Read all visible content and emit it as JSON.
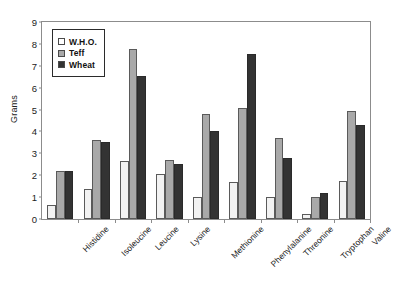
{
  "chart_data": {
    "type": "bar",
    "title": "",
    "xlabel": "",
    "ylabel": "Grams",
    "ylim": [
      0,
      9
    ],
    "yticks": [
      0,
      1,
      2,
      3,
      4,
      5,
      6,
      7,
      8,
      9
    ],
    "grid": false,
    "legend_position": "top-left-inside",
    "categories": [
      "Histidine",
      "Isoleucine",
      "Leucine",
      "Lysine",
      "Methionine",
      "Phenylalanine",
      "Threonine",
      "Tryptophan",
      "Valine"
    ],
    "series": [
      {
        "name": "W.H.O.",
        "color": "#f2f2f2",
        "values": [
          0.65,
          1.35,
          2.65,
          2.05,
          1.0,
          1.7,
          1.0,
          0.25,
          1.75
        ]
      },
      {
        "name": "Teff",
        "color": "#a9a9a9",
        "values": [
          2.2,
          3.6,
          7.75,
          2.7,
          4.8,
          5.05,
          3.7,
          1.0,
          4.95
        ]
      },
      {
        "name": "Wheat",
        "color": "#333333",
        "values": [
          2.2,
          3.5,
          6.55,
          2.5,
          4.0,
          7.55,
          2.8,
          1.2,
          4.3
        ]
      }
    ]
  }
}
